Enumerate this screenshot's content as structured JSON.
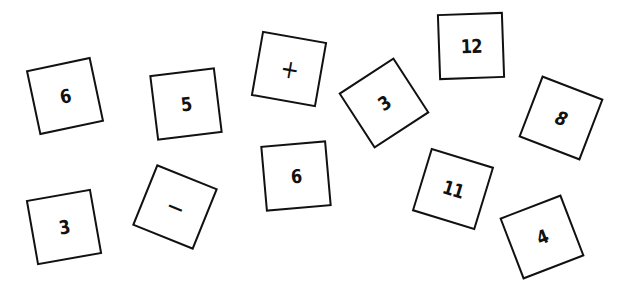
{
  "cards": [
    {
      "label": "6",
      "cx": 65,
      "cy": 96,
      "rot": -12
    },
    {
      "label": "5",
      "cx": 186,
      "cy": 104,
      "rot": -7
    },
    {
      "label": "+",
      "cx": 289,
      "cy": 69,
      "rot": 10
    },
    {
      "label": "3",
      "cx": 384,
      "cy": 103,
      "rot": -33
    },
    {
      "label": "12",
      "cx": 471,
      "cy": 46,
      "rot": -2
    },
    {
      "label": "8",
      "cx": 561,
      "cy": 118,
      "rot": 21
    },
    {
      "label": "3",
      "cx": 64,
      "cy": 227,
      "rot": -10
    },
    {
      "label": "−",
      "cx": 175,
      "cy": 207,
      "rot": 22
    },
    {
      "label": "6",
      "cx": 296,
      "cy": 176,
      "rot": -5
    },
    {
      "label": "11",
      "cx": 453,
      "cy": 189,
      "rot": 17
    },
    {
      "label": "4",
      "cx": 542,
      "cy": 237,
      "rot": -21
    }
  ],
  "colors": {
    "border": "#111111",
    "background": "#ffffff"
  }
}
